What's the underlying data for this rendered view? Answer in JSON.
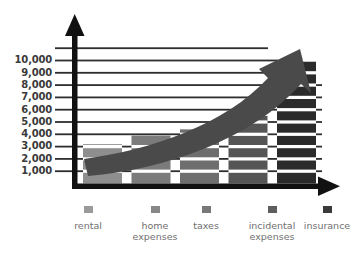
{
  "chart_data": {
    "type": "bar",
    "title": "",
    "xlabel": "",
    "ylabel": "",
    "categories": [
      "rental",
      "home expenses",
      "taxes",
      "incidental expenses",
      "insurance"
    ],
    "values": [
      3200,
      3900,
      4400,
      5500,
      9900
    ],
    "ylim": [
      0,
      11000
    ],
    "yticks": [
      1000,
      2000,
      3000,
      4000,
      5000,
      6000,
      7000,
      8000,
      9000,
      10000
    ],
    "ytick_labels": [
      "1,000",
      "2,000",
      "3,000",
      "4,000",
      "5,000",
      "6,000",
      "7,000",
      "8,000",
      "9,000",
      "10,000"
    ],
    "gridlines": 11,
    "grid": true,
    "legend_position": "bottom",
    "series": [
      {
        "name": "annual cost",
        "values": [
          3200,
          3900,
          4400,
          5500,
          9900
        ]
      }
    ],
    "bar_colors": [
      "#8e8e8e",
      "#7b7b7b",
      "#6e6e6e",
      "#555555",
      "#2b2b2b"
    ],
    "annotation": "upward growth arrow"
  },
  "axes": {
    "y_arrow_icon": "arrow-up",
    "x_arrow_icon": "arrow-right",
    "axis_color": "#1a1a1a"
  },
  "growth_arrow": {
    "icon": "curved-growth-arrow",
    "color": "#4a4a4a",
    "direction": "up-right"
  },
  "legend": {
    "items": [
      {
        "label_line1": "rental",
        "label_line2": "",
        "color": "#9a9a9a"
      },
      {
        "label_line1": "home",
        "label_line2": "expenses",
        "color": "#888888"
      },
      {
        "label_line1": "taxes",
        "label_line2": "",
        "color": "#787878"
      },
      {
        "label_line1": "incidental",
        "label_line2": "expenses",
        "color": "#5e5e5e"
      },
      {
        "label_line1": "insurance",
        "label_line2": "",
        "color": "#3a3a3a"
      }
    ]
  }
}
